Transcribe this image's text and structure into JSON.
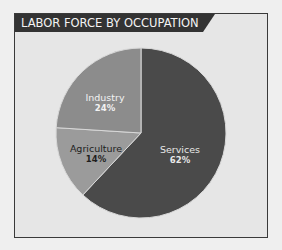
{
  "chart_data": {
    "type": "pie",
    "title": "LABOR FORCE BY OCCUPATION",
    "categories": [
      "Services",
      "Agriculture",
      "Industry"
    ],
    "values": [
      62,
      14,
      24
    ],
    "unit": "%",
    "labels": [
      {
        "name": "Services",
        "pct": "62%"
      },
      {
        "name": "Agriculture",
        "pct": "14%"
      },
      {
        "name": "Industry",
        "pct": "24%"
      }
    ],
    "colors": [
      "#4a4a4a",
      "#9b9b9b",
      "#8c8c8c"
    ],
    "start_angle_deg": 0,
    "direction": "clockwise",
    "legend": "none (labels inside slices)"
  },
  "colors": {
    "page_bg": "#efefef",
    "frame_bg": "#e6e6e6",
    "title_bar": "#333333",
    "title_text": "#f4f4f4"
  }
}
